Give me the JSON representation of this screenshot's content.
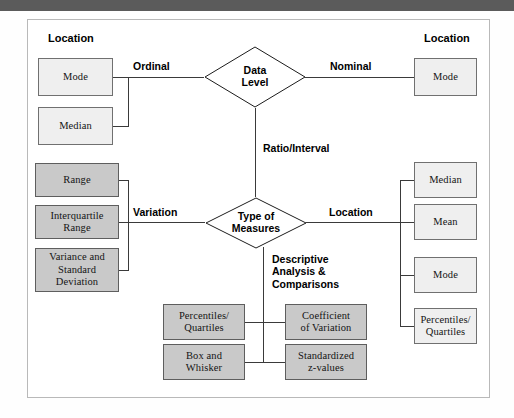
{
  "figure": {
    "type": "flowchart"
  },
  "colors": {
    "node_light_fill": "#efefef",
    "node_mid_fill": "#c9c9c9",
    "node_stroke": "#707070",
    "line": "#3a3a3a",
    "frame": "#b9b9b9",
    "top_band": "#5b5b5b"
  },
  "column_headings": {
    "left": "Location",
    "right": "Location"
  },
  "decisions": [
    {
      "id": "data-level",
      "line1": "Data",
      "line2": "Level"
    },
    {
      "id": "type-of-measures",
      "line1": "Type of",
      "line2": "Measures"
    }
  ],
  "edge_labels": {
    "ordinal": "Ordinal",
    "nominal": "Nominal",
    "ratio_interval": "Ratio/Interval",
    "variation": "Variation",
    "location_right": "Location",
    "descriptive": "Descriptive\nAnalysis &\nComparisons"
  },
  "nodes": {
    "left_location": [
      {
        "id": "left-mode",
        "label": "Mode",
        "shade": "light"
      },
      {
        "id": "left-median",
        "label": "Median",
        "shade": "light"
      }
    ],
    "left_variation": [
      {
        "id": "range",
        "label": "Range",
        "shade": "mid"
      },
      {
        "id": "interquartile",
        "label": "Interquartile\nRange",
        "shade": "mid"
      },
      {
        "id": "variance-sd",
        "label": "Variance and\nStandard\nDeviation",
        "shade": "mid"
      }
    ],
    "right_nominal": [
      {
        "id": "nominal-mode",
        "label": "Mode",
        "shade": "light"
      }
    ],
    "right_location": [
      {
        "id": "right-median",
        "label": "Median",
        "shade": "light"
      },
      {
        "id": "right-mean",
        "label": "Mean",
        "shade": "light"
      },
      {
        "id": "right-mode",
        "label": "Mode",
        "shade": "light"
      },
      {
        "id": "right-percentiles",
        "label": "Percentiles/\nQuartiles",
        "shade": "light"
      }
    ],
    "descriptive_left": [
      {
        "id": "desc-percentiles",
        "label": "Percentiles/\nQuartiles",
        "shade": "mid"
      },
      {
        "id": "desc-boxwhisker",
        "label": "Box and\nWhisker",
        "shade": "mid"
      }
    ],
    "descriptive_right": [
      {
        "id": "desc-coefvar",
        "label": "Coefficient\nof Variation",
        "shade": "mid"
      },
      {
        "id": "desc-zvalues",
        "label": "Standardized\nz-values",
        "shade": "mid"
      }
    ]
  }
}
